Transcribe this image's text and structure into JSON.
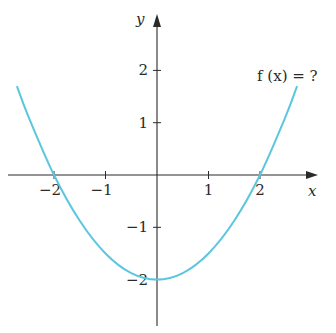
{
  "chart_data": {
    "type": "line",
    "title": "",
    "xlabel": "x",
    "ylabel": "y",
    "xlim": [
      -2.9,
      3.1
    ],
    "ylim": [
      -2.95,
      3.1
    ],
    "grid": false,
    "x_ticks": [
      {
        "value": -2,
        "label": "−2"
      },
      {
        "value": -1,
        "label": "−1"
      },
      {
        "value": 1,
        "label": "1"
      },
      {
        "value": 2,
        "label": "2"
      }
    ],
    "y_ticks": [
      {
        "value": 2,
        "label": "2"
      },
      {
        "value": 1,
        "label": "1"
      },
      {
        "value": -1,
        "label": "−1"
      },
      {
        "value": -2,
        "label": "−2"
      }
    ],
    "series": [
      {
        "name": "f(x)",
        "color": "#5bc6de",
        "x_range": [
          -2.72,
          2.72
        ],
        "x": [
          -2.72,
          -2.5,
          -2,
          -1.5,
          -1,
          -0.5,
          0,
          0.5,
          1,
          1.5,
          2,
          2.5,
          2.72
        ],
        "y": [
          1.7,
          1.125,
          0,
          -0.875,
          -1.5,
          -1.875,
          -2,
          -1.875,
          -1.5,
          -0.875,
          0,
          1.125,
          1.7
        ]
      }
    ],
    "annotations": [
      {
        "text": "f (x) = ?",
        "near": "top-right"
      }
    ],
    "axis_color": "#2a2a2a"
  }
}
